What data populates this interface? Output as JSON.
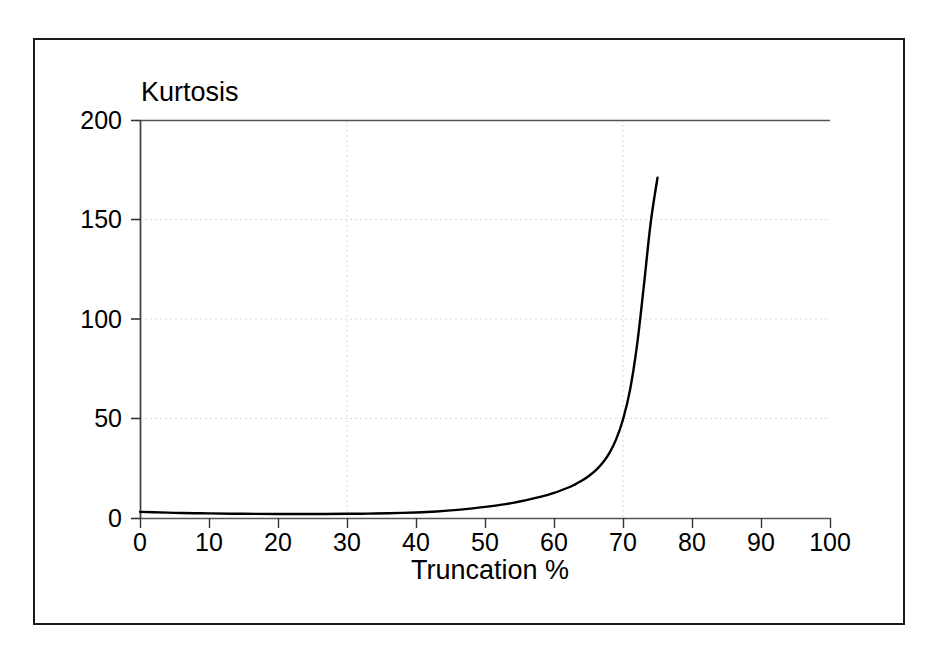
{
  "chart_data": {
    "type": "line",
    "title": "",
    "xlabel": "Truncation %",
    "ylabel": "Kurtosis",
    "xlim": [
      0,
      100
    ],
    "ylim": [
      0,
      200
    ],
    "xticks": [
      "0",
      "10",
      "20",
      "30",
      "40",
      "50",
      "60",
      "70",
      "80",
      "90",
      "100"
    ],
    "xtick_values": [
      0,
      10,
      20,
      30,
      40,
      50,
      60,
      70,
      80,
      90,
      100
    ],
    "yticks": [
      "0",
      "50",
      "100",
      "150",
      "200"
    ],
    "ytick_values": [
      0,
      50,
      100,
      150,
      200
    ],
    "grid": "faint dotted horizontal gridlines at 50, 100, 150 and solid line at 200; faint dotted vertical gridlines at 40 and 70",
    "legend": "none",
    "line_color": "#000000",
    "series": [
      {
        "name": "Kurtosis vs Truncation %",
        "x": [
          0,
          2,
          5,
          8,
          10,
          15,
          20,
          25,
          30,
          33,
          36,
          40,
          43,
          46,
          50,
          53,
          56,
          58,
          60,
          62,
          63,
          64,
          65,
          66,
          67,
          68,
          69,
          70,
          71,
          72,
          73,
          74,
          75
        ],
        "values": [
          3.1,
          2.9,
          2.6,
          2.4,
          2.3,
          2.1,
          2.0,
          2.0,
          2.1,
          2.2,
          2.4,
          2.8,
          3.3,
          4.1,
          5.6,
          7.0,
          9.0,
          10.6,
          12.6,
          15.2,
          16.8,
          18.7,
          21.0,
          23.8,
          27.5,
          32.5,
          39.5,
          49.5,
          64.0,
          86.0,
          116.0,
          148.0,
          171.0
        ]
      }
    ],
    "annotations": [
      "Curve is nearly flat near a value of about 2-3 from 0% up to roughly 40% truncation, then rises exponentially.",
      "Curve crosses 50 at about 69-70% truncation.",
      "Curve crosses 100 at about 72% truncation.",
      "Curve crosses 150 at about 74% truncation.",
      "Curve terminates at about 75% truncation with a value near 171."
    ]
  },
  "axes": {
    "y_title": "Kurtosis",
    "x_title": "Truncation %"
  }
}
